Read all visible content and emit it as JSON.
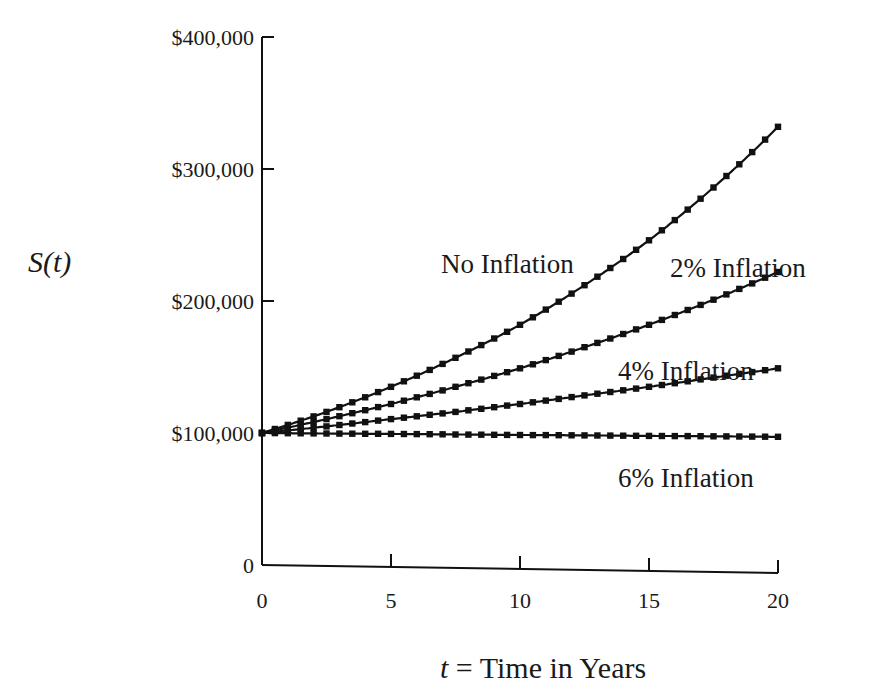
{
  "chart_data": {
    "type": "line",
    "title": "",
    "xlabel": "t = Time in Years",
    "xlabel_var": "t",
    "xlabel_rest": " = Time in Years",
    "ylabel": "S(t)",
    "xlim": [
      0,
      20
    ],
    "ylim": [
      0,
      400000
    ],
    "x_ticks": [
      0,
      5,
      10,
      15,
      20
    ],
    "x_tick_labels": [
      "0",
      "5",
      "10",
      "15",
      "20"
    ],
    "y_ticks": [
      0,
      100000,
      200000,
      300000,
      400000
    ],
    "y_tick_labels": [
      "0",
      "$100,000",
      "$200,000",
      "$300,000",
      "$400,000"
    ],
    "grid": false,
    "legend": "inline labels",
    "x": [
      0,
      2.5,
      5,
      7.5,
      10,
      12.5,
      15,
      17.5,
      20
    ],
    "series": [
      {
        "name": "No Inflation",
        "values": [
          100000,
          116000,
          135000,
          157000,
          182000,
          212000,
          246000,
          286000,
          332000
        ]
      },
      {
        "name": "2% Inflation",
        "values": [
          100000,
          110500,
          122000,
          135000,
          149000,
          165000,
          182000,
          201000,
          222000
        ]
      },
      {
        "name": "4% Inflation",
        "values": [
          100000,
          105000,
          110500,
          116000,
          122000,
          128500,
          135000,
          142000,
          149000
        ]
      },
      {
        "name": "6% Inflation",
        "values": [
          100000,
          99600,
          99300,
          98900,
          98500,
          98200,
          97800,
          97500,
          97100
        ]
      }
    ],
    "line_color": "#111111",
    "marker": "square"
  },
  "labels": {
    "no_inflation": "No Inflation",
    "inflation_2": "2% Inflation",
    "inflation_4": "4% Inflation",
    "inflation_6": "6% Inflation"
  }
}
